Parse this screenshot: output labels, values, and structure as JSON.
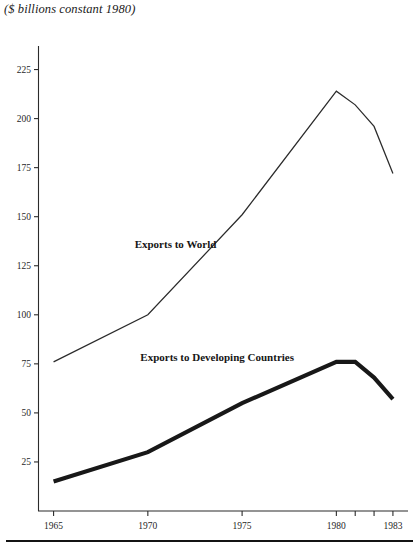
{
  "figure": {
    "title": "($ billions constant 1980)"
  },
  "chart_data": {
    "type": "line",
    "title": "($ billions constant 1980)",
    "xlabel": "",
    "ylabel": "$ billions constant 1980",
    "xlim": [
      1964.2,
      1983.8
    ],
    "ylim": [
      0,
      237
    ],
    "grid": false,
    "legend": "inline-labels",
    "x_ticks": [
      1965,
      1970,
      1975,
      1980,
      1981,
      1982,
      1983
    ],
    "x_tick_labels": [
      "1965",
      "1970",
      "1975",
      "1980",
      "",
      "",
      "1983"
    ],
    "y_ticks": [
      25,
      50,
      75,
      100,
      125,
      150,
      175,
      200,
      225
    ],
    "y_tick_labels": [
      "25",
      "50",
      "75",
      "100",
      "125",
      "150",
      "175",
      "200",
      "225"
    ],
    "series": [
      {
        "name": "Exports to World",
        "label": "Exports to World",
        "style": "thin",
        "color": "#2b2b2b",
        "x": [
          1965,
          1970,
          1975,
          1980,
          1981,
          1982,
          1983
        ],
        "values": [
          76,
          100,
          151,
          214,
          207,
          196,
          172
        ],
        "label_x": 1969.3,
        "label_y": 134
      },
      {
        "name": "Exports to Developing Countries",
        "label": "Exports to Developing Countries",
        "style": "thick",
        "color": "#181818",
        "x": [
          1965,
          1970,
          1975,
          1980,
          1981,
          1982,
          1983
        ],
        "values": [
          15,
          30,
          55,
          76,
          76,
          68,
          57
        ],
        "label_x": 1969.6,
        "label_y": 76.5
      }
    ]
  }
}
